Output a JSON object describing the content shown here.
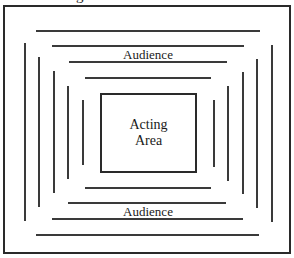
{
  "caption_fragment": "g",
  "diagram": {
    "type": "theatre-in-the-round seating layout",
    "acting_area": {
      "line1": "Acting",
      "line2": "Area"
    },
    "labels": {
      "top_audience": "Audience",
      "bottom_audience": "Audience"
    },
    "colors": {
      "stroke": "#2a2a2a",
      "background": "#ffffff"
    }
  }
}
